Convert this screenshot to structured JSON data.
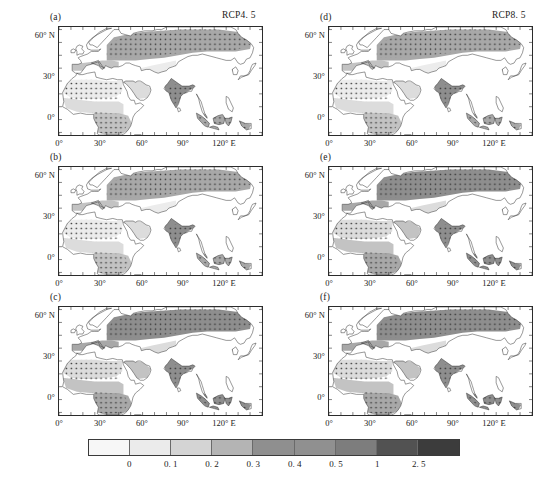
{
  "figure": {
    "domain": "chart",
    "kind": "map-grid",
    "width": 548,
    "height": 491,
    "background": "#ffffff"
  },
  "columns": [
    {
      "id": "left",
      "scenario_label": "RCP4. 5"
    },
    {
      "id": "right",
      "scenario_label": "RCP8. 5"
    }
  ],
  "panels": [
    {
      "id": "a",
      "label": "(a)",
      "column": "left",
      "row": 0
    },
    {
      "id": "b",
      "label": "(b)",
      "column": "left",
      "row": 1
    },
    {
      "id": "c",
      "label": "(c)",
      "column": "left",
      "row": 2
    },
    {
      "id": "d",
      "label": "(d)",
      "column": "right",
      "row": 0
    },
    {
      "id": "e",
      "label": "(e)",
      "column": "right",
      "row": 1
    },
    {
      "id": "f",
      "label": "(f)",
      "column": "right",
      "row": 2
    }
  ],
  "axes": {
    "y_ticks": [
      "60° N",
      "30°",
      "0°"
    ],
    "y_values": [
      60,
      30,
      0
    ],
    "x_ticks": [
      "0°",
      "30°",
      "60°",
      "90°",
      "120° E"
    ],
    "x_values": [
      0,
      30,
      60,
      90,
      120
    ],
    "lon_range": [
      -20,
      150
    ],
    "lat_range": [
      -12,
      72
    ]
  },
  "colorbar": {
    "orientation": "horizontal",
    "tick_labels": [
      "0",
      "0. 1",
      "0. 2",
      "0. 3",
      "0. 4",
      "0. 5",
      "1",
      "2. 5"
    ],
    "tick_values": [
      0,
      0.1,
      0.2,
      0.3,
      0.4,
      0.5,
      1,
      2.5
    ],
    "segment_colors": [
      "#f7f7f7",
      "#ebebeb",
      "#d4d4d4",
      "#b4b4b4",
      "#8f8f8f",
      "#909090",
      "#7d7d7d",
      "#525252",
      "#3c3c3c"
    ],
    "segment_count": 9
  },
  "chart_data": {
    "type": "heatmap",
    "title": "",
    "subtitle": "",
    "xlabel": "",
    "ylabel": "",
    "grid": false,
    "legend_position": "bottom",
    "panel_titles": [
      "(a)",
      "(b)",
      "(c)",
      "(d)",
      "(e)",
      "(f)"
    ],
    "column_titles": [
      "RCP4. 5",
      "RCP8. 5"
    ],
    "x": [
      0,
      30,
      60,
      90,
      120
    ],
    "xtick_labels": [
      "0°",
      "30°",
      "60°",
      "90°",
      "120° E"
    ],
    "y": [
      0,
      30,
      60
    ],
    "ytick_labels": [
      "0°",
      "30°",
      "60° N"
    ],
    "xlim": [
      -20,
      150
    ],
    "ylim": [
      -12,
      72
    ],
    "colorbar_levels": [
      0,
      0.1,
      0.2,
      0.3,
      0.4,
      0.5,
      1,
      2.5
    ],
    "colorbar_tick_labels": [
      "0",
      "0. 1",
      "0. 2",
      "0. 3",
      "0. 4",
      "0. 5",
      "1",
      "2. 5"
    ],
    "colorbar_colors": [
      "#f7f7f7",
      "#ebebeb",
      "#d4d4d4",
      "#b4b4b4",
      "#8f8f8f",
      "#909090",
      "#7d7d7d",
      "#525252",
      "#3c3c3c"
    ],
    "stippling": "dotted hatch marks significance",
    "regions_described": [
      "Africa",
      "Europe",
      "Middle East",
      "Central Asia",
      "South Asia",
      "East Asia",
      "Southeast Asia / Maritime Continent"
    ]
  }
}
